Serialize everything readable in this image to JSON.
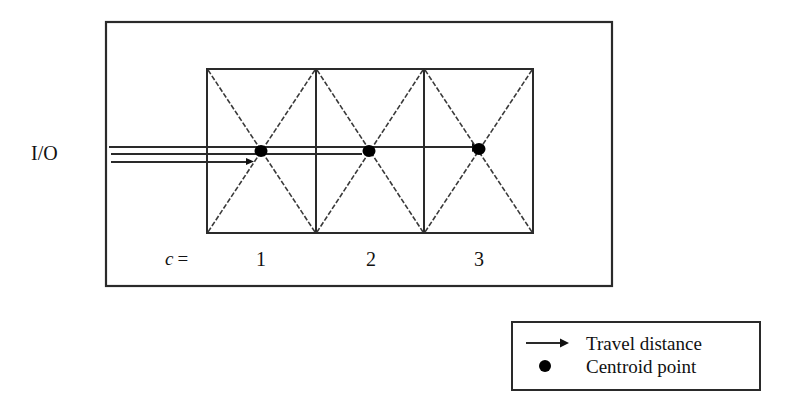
{
  "diagram": {
    "io_label": "I/O",
    "cell_index_label": "c",
    "cell_index_equals": "=",
    "cells": [
      {
        "number": "1"
      },
      {
        "number": "2"
      },
      {
        "number": "3"
      }
    ]
  },
  "legend": {
    "items": [
      {
        "symbol": "arrow",
        "label": "Travel distance"
      },
      {
        "symbol": "dot",
        "label": "Centroid point"
      }
    ]
  },
  "colors": {
    "line": "#2a2a2a",
    "dashed": "#3a3a3a",
    "centroid": "#000000",
    "background": "#ffffff"
  }
}
